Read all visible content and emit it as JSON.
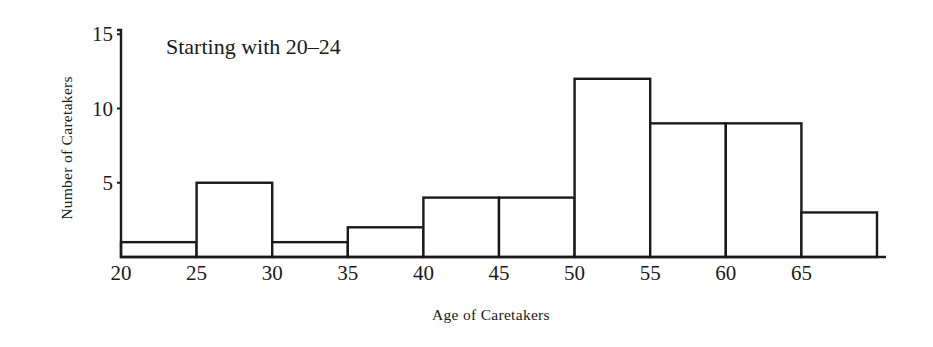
{
  "chart_data": {
    "type": "bar",
    "subtype": "histogram",
    "title": "Starting with 20–24",
    "xlabel": "Age of Caretakers",
    "ylabel": "Number of Caretakers",
    "bins": [
      {
        "start": 20,
        "end": 25,
        "value": 1
      },
      {
        "start": 25,
        "end": 30,
        "value": 5
      },
      {
        "start": 30,
        "end": 35,
        "value": 1
      },
      {
        "start": 35,
        "end": 40,
        "value": 2
      },
      {
        "start": 40,
        "end": 45,
        "value": 4
      },
      {
        "start": 45,
        "end": 50,
        "value": 4
      },
      {
        "start": 50,
        "end": 55,
        "value": 12
      },
      {
        "start": 55,
        "end": 60,
        "value": 9
      },
      {
        "start": 60,
        "end": 65,
        "value": 9
      },
      {
        "start": 65,
        "end": 70,
        "value": 3
      }
    ],
    "categories": [
      "20-24",
      "25-29",
      "30-34",
      "35-39",
      "40-44",
      "45-49",
      "50-54",
      "55-59",
      "60-64",
      "65-69"
    ],
    "values": [
      1,
      5,
      1,
      2,
      4,
      4,
      12,
      9,
      9,
      3
    ],
    "x_ticks": [
      "20",
      "25",
      "30",
      "35",
      "40",
      "45",
      "50",
      "55",
      "60",
      "65"
    ],
    "y_ticks": [
      "5",
      "10",
      "15"
    ],
    "xlim": [
      20,
      70
    ],
    "ylim": [
      0,
      15
    ],
    "grid": false,
    "legend": null
  }
}
